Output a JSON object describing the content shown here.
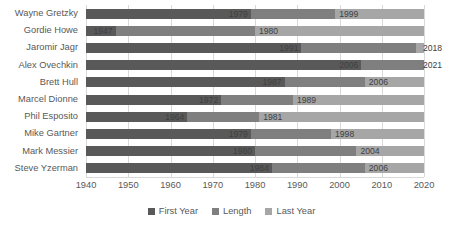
{
  "chart_data": {
    "type": "bar",
    "subtype": "stacked-bar-horizontal",
    "title": "",
    "xlabel": "",
    "ylabel": "",
    "xlim": [
      1940,
      2020
    ],
    "xticks": [
      1940,
      1950,
      1960,
      1970,
      1980,
      1990,
      2000,
      2010,
      2020
    ],
    "grid": true,
    "legend_position": "bottom",
    "categories": [
      "Wayne Gretzky",
      "Gordie Howe",
      "Jaromir Jagr",
      "Alex Ovechkin",
      "Brett Hull",
      "Marcel Dionne",
      "Phil Esposito",
      "Mike Gartner",
      "Mark Messier",
      "Steve Yzerman"
    ],
    "series": [
      {
        "name": "First Year",
        "color": "#595959",
        "values": [
          1979,
          1947,
          1991,
          2006,
          1987,
          1972,
          1964,
          1979,
          1980,
          1984
        ]
      },
      {
        "name": "Length",
        "color": "#7f7f7f",
        "values": [
          20,
          33,
          27,
          15,
          19,
          17,
          17,
          19,
          24,
          22
        ]
      },
      {
        "name": "Last Year",
        "color": "#a6a6a6",
        "values": [
          1999,
          1980,
          2018,
          2021,
          2006,
          1989,
          1981,
          1998,
          2004,
          2006
        ]
      }
    ],
    "rows": [
      {
        "name": "Wayne Gretzky",
        "first_year": 1979,
        "first_year_label": "1979",
        "last_year": 1999,
        "last_year_label": "1999",
        "length": 20
      },
      {
        "name": "Gordie Howe",
        "first_year": 1947,
        "first_year_label": "1947",
        "last_year": 1980,
        "last_year_label": "1980",
        "length": 33
      },
      {
        "name": "Jaromir Jagr",
        "first_year": 1991,
        "first_year_label": "1991",
        "last_year": 2018,
        "last_year_label": "2018",
        "length": 27
      },
      {
        "name": "Alex Ovechkin",
        "first_year": 2006,
        "first_year_label": "2006",
        "last_year": 2021,
        "last_year_label": "2021",
        "length": 15
      },
      {
        "name": "Brett Hull",
        "first_year": 1987,
        "first_year_label": "1987",
        "last_year": 2006,
        "last_year_label": "2006",
        "length": 19
      },
      {
        "name": "Marcel Dionne",
        "first_year": 1972,
        "first_year_label": "1972",
        "last_year": 1989,
        "last_year_label": "1989",
        "length": 17
      },
      {
        "name": "Phil Esposito",
        "first_year": 1964,
        "first_year_label": "1964",
        "last_year": 1981,
        "last_year_label": "1981",
        "length": 17
      },
      {
        "name": "Mike Gartner",
        "first_year": 1979,
        "first_year_label": "1979",
        "last_year": 1998,
        "last_year_label": "1998",
        "length": 19
      },
      {
        "name": "Mark Messier",
        "first_year": 1980,
        "first_year_label": "1980",
        "last_year": 2004,
        "last_year_label": "2004",
        "length": 24
      },
      {
        "name": "Steve Yzerman",
        "first_year": 1984,
        "first_year_label": "1984",
        "last_year": 2006,
        "last_year_label": "2006",
        "length": 22
      }
    ],
    "legend": [
      {
        "label": "First Year",
        "color": "#595959"
      },
      {
        "label": "Length",
        "color": "#7f7f7f"
      },
      {
        "label": "Last Year",
        "color": "#a6a6a6"
      }
    ]
  }
}
